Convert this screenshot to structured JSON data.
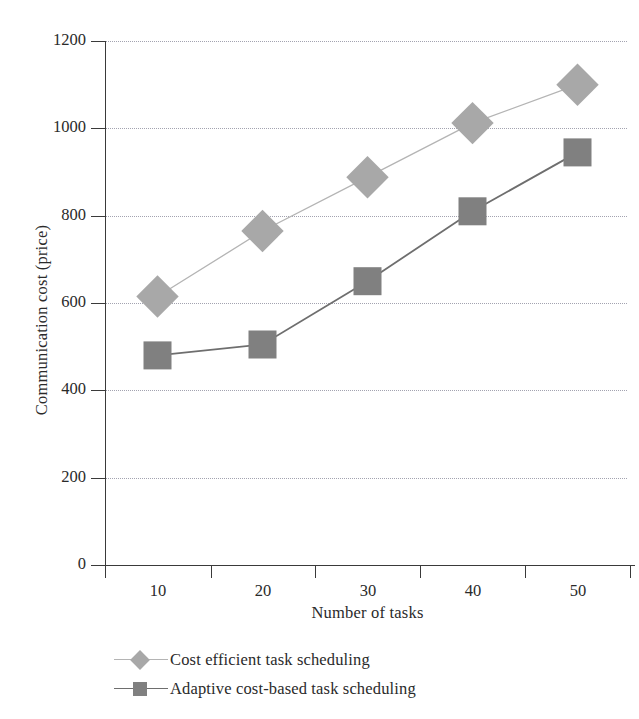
{
  "chart_data": {
    "type": "line",
    "title": "",
    "xlabel": "Number of tasks",
    "ylabel": "Communication cost (price)",
    "x": [
      10,
      20,
      30,
      40,
      50
    ],
    "xticklabels": [
      "10",
      "20",
      "30",
      "40",
      "50"
    ],
    "yticklabels": [
      "0",
      "200",
      "400",
      "600",
      "800",
      "1000",
      "1200"
    ],
    "yticks": [
      0,
      200,
      400,
      600,
      800,
      1000,
      1200
    ],
    "xlim": [
      5,
      55
    ],
    "ylim": [
      0,
      1200
    ],
    "grid": "horizontal-dotted",
    "legend_position": "below-axes-left",
    "series": [
      {
        "name": "Cost efficient task scheduling",
        "marker": "diamond",
        "color": "#a8a8a8",
        "line_color": "#b4b4b4",
        "values": [
          615,
          765,
          888,
          1012,
          1100
        ]
      },
      {
        "name": "Adaptive cost-based task scheduling",
        "marker": "square",
        "color": "#808080",
        "line_color": "#6e6e6e",
        "values": [
          480,
          505,
          650,
          810,
          945
        ]
      }
    ]
  },
  "axes": {
    "y_label": "Communication cost (price)",
    "x_label": "Number of tasks",
    "y_ticks": [
      "1200",
      "1000",
      "800",
      "600",
      "400",
      "200",
      "0"
    ],
    "x_ticks": [
      "10",
      "20",
      "30",
      "40",
      "50"
    ]
  },
  "legend": {
    "items": [
      {
        "label": "Cost efficient task scheduling",
        "marker": "diamond",
        "color": "#a8a8a8"
      },
      {
        "label": "Adaptive cost-based task scheduling",
        "marker": "square",
        "color": "#808080"
      }
    ]
  },
  "colors": {
    "series_light": "#a8a8a8",
    "series_dark": "#808080",
    "axis": "#3a3a3a",
    "grid": "#9a9aa8",
    "text": "#2a2a2a",
    "background": "#ffffff"
  }
}
